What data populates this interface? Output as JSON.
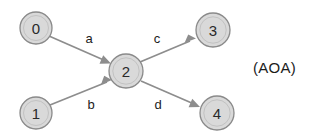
{
  "diagram": {
    "type": "activity-on-arrow-network",
    "annotation": "(AOA)",
    "background_color": "#ffffff",
    "node_fill_color": "#d9d9d9",
    "node_stroke_color": "#8a8a8a",
    "edge_color": "#8d8d8d",
    "text_color": "#1c1c1c",
    "nodes": [
      {
        "id": "0",
        "label": "0",
        "cx": 36,
        "cy": 28,
        "r": 16
      },
      {
        "id": "1",
        "label": "1",
        "cx": 36,
        "cy": 113,
        "r": 16
      },
      {
        "id": "2",
        "label": "2",
        "cx": 126,
        "cy": 71,
        "r": 17
      },
      {
        "id": "3",
        "label": "3",
        "cx": 213,
        "cy": 30,
        "r": 17
      },
      {
        "id": "4",
        "label": "4",
        "cx": 217,
        "cy": 113,
        "r": 17
      }
    ],
    "edges": [
      {
        "id": "a",
        "label": "a",
        "from": "0",
        "to": "2",
        "label_x": 89,
        "label_y": 38
      },
      {
        "id": "b",
        "label": "b",
        "from": "1",
        "to": "2",
        "label_x": 91,
        "label_y": 104
      },
      {
        "id": "c",
        "label": "c",
        "from": "2",
        "to": "3",
        "label_x": 157,
        "label_y": 38
      },
      {
        "id": "d",
        "label": "d",
        "from": "2",
        "to": "4",
        "label_x": 158,
        "label_y": 104
      }
    ],
    "annotation_x": 253,
    "annotation_y": 67
  }
}
